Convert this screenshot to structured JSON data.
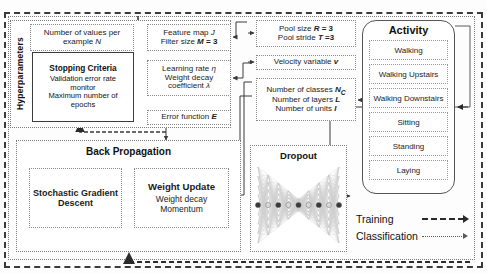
{
  "diagram": {
    "hyperparameters": {
      "group_label": "Hyperparameters",
      "boxes": [
        {
          "name": "number-of-values",
          "lines": [
            "Number of values per",
            "example N"
          ]
        },
        {
          "name": "stopping-criteria",
          "title": "Stopping Criteria",
          "lines": [
            "Validation error rate",
            "monitor",
            "Maximum number of",
            "epochs"
          ]
        },
        {
          "name": "feature-map",
          "lines": [
            "Feature map J",
            "Filter size M = 3"
          ]
        },
        {
          "name": "learning-rate",
          "lines": [
            "Learning rate η",
            "Weight decay",
            "coefficient λ"
          ]
        },
        {
          "name": "error-function",
          "lines": [
            "Error function E"
          ]
        },
        {
          "name": "pool-size",
          "lines": [
            "Pool size R = 3",
            "Pool stride T =3"
          ]
        },
        {
          "name": "velocity-variable",
          "lines": [
            "Velocity variable v"
          ]
        },
        {
          "name": "layer-counts",
          "lines": [
            "Number of classes N_C",
            "Number of layers L",
            "Number of units I"
          ]
        }
      ]
    },
    "back_propagation": {
      "title": "Back Propagation",
      "sgd": {
        "lines": [
          "Stochastic Gradient",
          "Descent"
        ]
      },
      "weight_update": {
        "title": "Weight Update",
        "lines": [
          "Weight decay",
          "Momentum"
        ]
      }
    },
    "dropout": {
      "title": "Dropout",
      "figure": "neural-network-dropout-graphic"
    },
    "activity": {
      "title": "Activity",
      "items": [
        "Walking",
        "Walking Upstairs",
        "Walking Downstairs",
        "Sitting",
        "Standing",
        "Laying"
      ]
    },
    "legend": [
      {
        "label": "Training",
        "style": "thick-dashed-arrow"
      },
      {
        "label": "Classification",
        "style": "thin-dotted-arrow"
      }
    ],
    "colors": {
      "stroke_dark": "#3a3a3a",
      "stroke_mid": "#7c7c7c",
      "text": "#111111",
      "background": "#ffffff"
    }
  }
}
